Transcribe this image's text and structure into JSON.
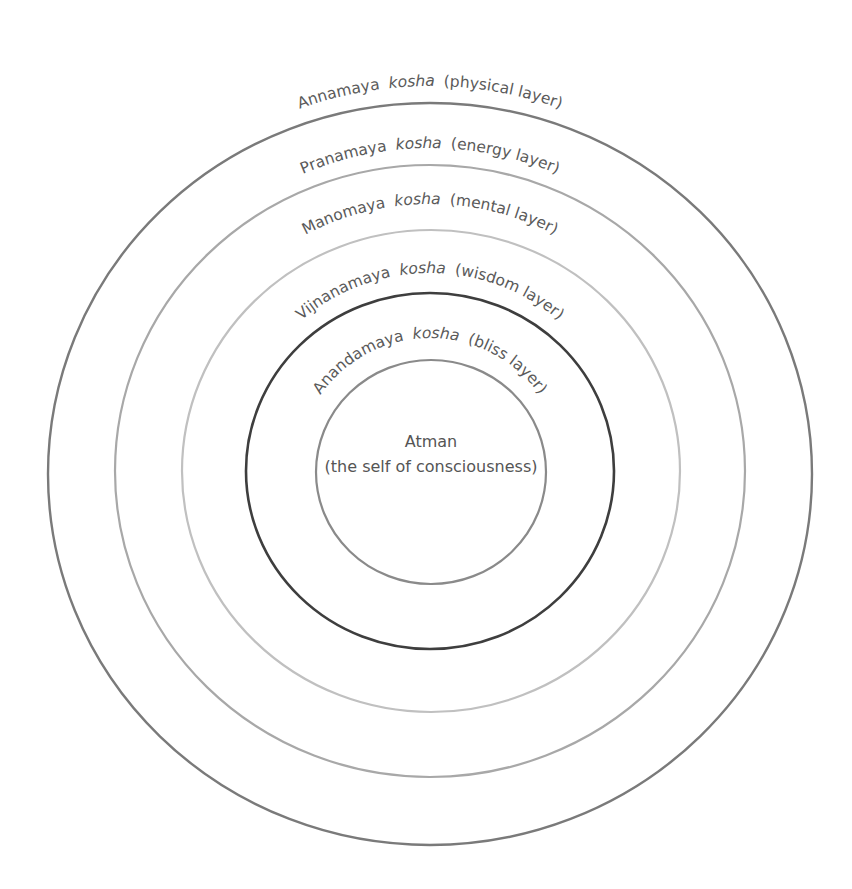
{
  "diagram": {
    "type": "concentric-layers",
    "center": {
      "line1": "Atman",
      "line2": "(the self of consciousness)"
    },
    "layers": [
      {
        "name": "Annamaya",
        "term": "kosha",
        "desc": "(physical layer)",
        "stroke": "#7a7a7a",
        "width": 2.4
      },
      {
        "name": "Pranamaya",
        "term": "kosha",
        "desc": "(energy layer)",
        "stroke": "#a8a8a8",
        "width": 2.2
      },
      {
        "name": "Manomaya",
        "term": "kosha",
        "desc": "(mental layer)",
        "stroke": "#c0c0c0",
        "width": 2.2
      },
      {
        "name": "Vijnanamaya",
        "term": "kosha",
        "desc": "(wisdom layer)",
        "stroke": "#3e3e3e",
        "width": 2.6
      },
      {
        "name": "Anandamaya",
        "term": "kosha",
        "desc": "(bliss layer)",
        "stroke": "#8a8a8a",
        "width": 2.2
      }
    ]
  }
}
